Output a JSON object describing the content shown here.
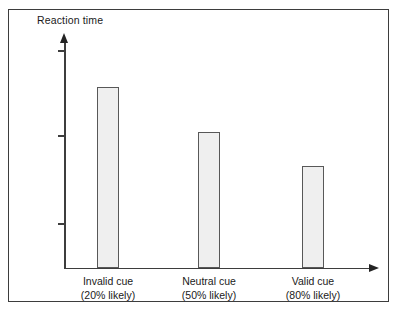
{
  "chart_data": {
    "type": "bar",
    "title": "",
    "subtitle": "",
    "xlabel": "",
    "ylabel": "Reaction time",
    "categories": [
      "Invalid cue",
      "Neutral cue",
      "Valid cue"
    ],
    "category_sublabels": [
      "(20% likely)",
      "(50% likely)",
      "(80% likely)"
    ],
    "values": [
      181,
      136,
      102
    ],
    "value_units": "relative pixel height (no numeric scale shown)",
    "ylim": [
      0,
      230
    ],
    "y_ticks": [
      102,
      187,
      275
    ],
    "y_tick_labels": [
      "",
      "",
      ""
    ],
    "grid": false,
    "legend": null,
    "axis_arrows": true,
    "annotations": []
  },
  "figure": {
    "y_axis_title": "Reaction time",
    "bars": [
      {
        "label": "Invalid cue",
        "sublabel": "(20% likely)",
        "value": 181,
        "left": 97,
        "width": 22,
        "top": 87
      },
      {
        "label": "Neutral cue",
        "sublabel": "(50% likely)",
        "value": 136,
        "left": 198,
        "width": 22,
        "top": 132
      },
      {
        "label": "Valid cue",
        "sublabel": "(80% likely)",
        "value": 102,
        "left": 302,
        "width": 22,
        "top": 166
      }
    ],
    "colors": {
      "bar_fill": "#efefef",
      "bar_stroke": "#585858",
      "axis": "#3d3d3d",
      "frame": "#3d3d3d",
      "text": "#1a1a1a",
      "background": "#ffffff"
    }
  }
}
